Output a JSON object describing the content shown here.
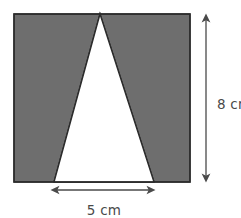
{
  "figure": {
    "kind": "geometry-diagram",
    "background_color": "#ffffff",
    "shaded_color": "#6e6e6e",
    "unshaded_color": "#ffffff",
    "outline_color": "#2b2b2b",
    "annotation_color": "#4a4a4a",
    "rectangle": {
      "x": 14,
      "y": 14,
      "width": 176,
      "height": 168
    },
    "triangle": {
      "apex_x": 100,
      "apex_y": 14,
      "base_left_x": 54,
      "base_right_x": 154,
      "base_y": 182
    },
    "dimensions": {
      "height": {
        "label": "8 cm",
        "value": 8,
        "unit": "cm",
        "orientation": "vertical",
        "line_x": 206,
        "y_start": 14,
        "y_end": 182,
        "label_x": 217,
        "label_y": 105
      },
      "width": {
        "label": "5 cm",
        "value": 5,
        "unit": "cm",
        "orientation": "horizontal",
        "line_y": 190,
        "x_start": 51,
        "x_end": 155,
        "label_x": 104,
        "label_y": 211
      }
    }
  }
}
